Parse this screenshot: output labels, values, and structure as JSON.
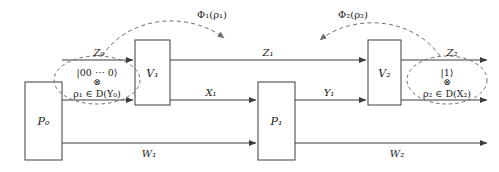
{
  "diagram": {
    "stroke_color": "#3c3c3c",
    "dashed_color": "#6e6e6e",
    "text_color": "#1a1a1a",
    "background": "#ffffff",
    "boxes": [
      {
        "id": "P0",
        "label": "P₀",
        "x": 25,
        "y": 82,
        "w": 37,
        "h": 78
      },
      {
        "id": "V1",
        "label": "V₁",
        "x": 135,
        "y": 40,
        "w": 35,
        "h": 65
      },
      {
        "id": "P1",
        "label": "P₁",
        "x": 258,
        "y": 82,
        "w": 37,
        "h": 78
      },
      {
        "id": "V2",
        "label": "V₂",
        "x": 368,
        "y": 40,
        "w": 33,
        "h": 65
      }
    ],
    "wires": [
      {
        "id": "Z0",
        "label": "Z₀",
        "y": 60,
        "x1": 62,
        "x2": 135
      },
      {
        "id": "rho1-in",
        "label": "",
        "y": 100,
        "x1": 62,
        "x2": 135
      },
      {
        "id": "Z1",
        "label": "Z₁",
        "y": 60,
        "x1": 170,
        "x2": 368
      },
      {
        "id": "X1",
        "label": "X₁",
        "y": 100,
        "x1": 170,
        "x2": 258
      },
      {
        "id": "Y1",
        "label": "Y₁",
        "y": 100,
        "x1": 295,
        "x2": 368
      },
      {
        "id": "Z2",
        "label": "Z₂",
        "y": 60,
        "x1": 401,
        "x2": 487
      },
      {
        "id": "rho2-out",
        "label": "",
        "y": 100,
        "x1": 401,
        "x2": 487
      },
      {
        "id": "W1",
        "label": "W₁",
        "y": 143,
        "x1": 62,
        "x2": 258
      },
      {
        "id": "W2",
        "label": "W₂",
        "y": 143,
        "x1": 295,
        "x2": 487
      }
    ],
    "ellipses": [
      {
        "id": "input-state",
        "cx": 97,
        "cy": 80,
        "rx": 43,
        "ry": 24,
        "ket": "|00 ⋯ 0⟩",
        "tensor": "⊗",
        "state": "ρ₁ ∈ D(Y₀)"
      },
      {
        "id": "output-state",
        "cx": 447,
        "cy": 80,
        "rx": 40,
        "ry": 24,
        "ket": "|1⟩",
        "tensor": "⊗",
        "state": "ρ₂ ∈ D(X₂)"
      }
    ],
    "channel_maps": [
      {
        "id": "phi1",
        "label": "Φ₁(ρ₁)",
        "x": 212,
        "y": 14
      },
      {
        "id": "phi2",
        "label": "Φ₂(ρ₂)",
        "x": 353,
        "y": 14
      }
    ]
  }
}
